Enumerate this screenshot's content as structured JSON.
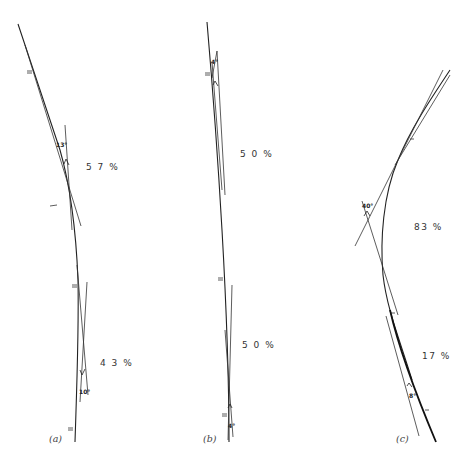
{
  "figure": {
    "panels": [
      {
        "id": "a",
        "label": "(a)",
        "upper_percent": "5 7 %",
        "lower_percent": "4 3 %",
        "upper_angle": "13°",
        "lower_angle": "10°"
      },
      {
        "id": "b",
        "label": "(b)",
        "upper_percent": "5 0 %",
        "lower_percent": "5 0 %",
        "upper_angle": "4°",
        "lower_angle": "4°"
      },
      {
        "id": "c",
        "label": "(c)",
        "upper_percent": "83 %",
        "lower_percent": "17 %",
        "upper_angle": "40°",
        "lower_angle": "8°"
      }
    ],
    "colors": {
      "ink": "#222222",
      "background": "#ffffff"
    }
  }
}
